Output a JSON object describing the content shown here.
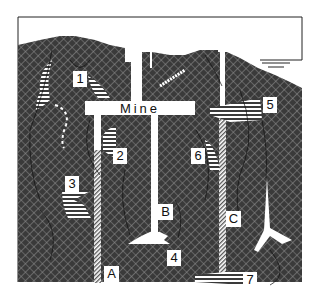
{
  "diagram": {
    "type": "geologic cross-section of a mine with shafts and ore bodies",
    "mine_label": "Mine",
    "shafts": [
      {
        "id": "A",
        "label": "A"
      },
      {
        "id": "B",
        "label": "B"
      },
      {
        "id": "C",
        "label": "C"
      }
    ],
    "ore_bodies": [
      {
        "id": "1",
        "label": "1"
      },
      {
        "id": "2",
        "label": "2"
      },
      {
        "id": "3",
        "label": "3"
      },
      {
        "id": "4",
        "label": "4"
      },
      {
        "id": "5",
        "label": "5"
      },
      {
        "id": "6",
        "label": "6"
      },
      {
        "id": "7",
        "label": "7"
      }
    ],
    "features": [
      "ground surface",
      "water body (lake)",
      "faults/fractures",
      "main vertical shaft",
      "horizontal drift"
    ],
    "colors": {
      "rock": "#3a3a3a",
      "rock_hatch": "#8a8a8a",
      "background": "#ffffff",
      "ore_stripe": "#ffffff"
    }
  }
}
